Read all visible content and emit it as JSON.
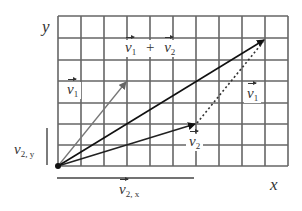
{
  "diagram": {
    "axes": {
      "x_label": "x",
      "y_label": "y"
    },
    "grid": {
      "columns": 10,
      "rows": 7
    },
    "vectors": [
      {
        "name": "v1",
        "label": "v",
        "subscript": "1",
        "from": [
          0,
          0
        ],
        "to": [
          3,
          4
        ],
        "color": "#777777",
        "style": "solid"
      },
      {
        "name": "v2",
        "label": "v",
        "subscript": "2",
        "from": [
          0,
          0
        ],
        "to": [
          6,
          2
        ],
        "color": "#222222",
        "style": "solid"
      },
      {
        "name": "sum",
        "label": "v1 + v2",
        "from": [
          0,
          0
        ],
        "to": [
          9,
          6
        ],
        "color": "#111111",
        "style": "solid"
      },
      {
        "name": "v1-shifted",
        "label": "v",
        "subscript": "1",
        "from": [
          6,
          2
        ],
        "to": [
          9,
          6
        ],
        "color": "#333333",
        "style": "dotted"
      }
    ],
    "labels": {
      "v1": {
        "base": "v",
        "sub": "1"
      },
      "sum": {
        "a": "v",
        "a_sub": "1",
        "op": "+",
        "b": "v",
        "b_sub": "2"
      },
      "v1_shift": {
        "base": "v",
        "sub": "1"
      },
      "v2": {
        "base": "v",
        "sub": "2"
      },
      "v2x": {
        "base": "v",
        "sub": "2, x"
      },
      "v2y": {
        "base": "v",
        "sub": "2, y"
      }
    }
  }
}
